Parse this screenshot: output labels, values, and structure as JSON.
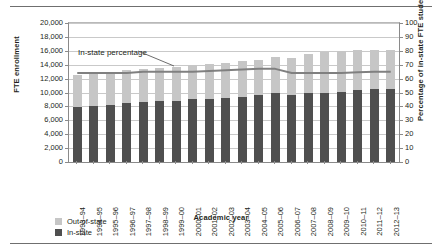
{
  "chart_data": {
    "type": "bar",
    "title": "",
    "subtitle": "",
    "xlabel": "Academic year",
    "ylabel": "FTE enrollment",
    "y2label": "Percentage of in-state FTE students",
    "grid": true,
    "legend_position": "bottom-left",
    "ylim": [
      0,
      20000
    ],
    "y2lim": [
      0,
      100
    ],
    "yticks": [
      "0",
      "2,000",
      "4,000",
      "6,000",
      "8,000",
      "10,000",
      "12,000",
      "14,000",
      "16,000",
      "18,000",
      "20,000"
    ],
    "ytick_values": [
      0,
      2000,
      4000,
      6000,
      8000,
      10000,
      12000,
      14000,
      16000,
      18000,
      20000
    ],
    "y2ticks": [
      "0",
      "10",
      "20",
      "30",
      "40",
      "50",
      "60",
      "70",
      "80",
      "90",
      "100"
    ],
    "y2tick_values": [
      0,
      10,
      20,
      30,
      40,
      50,
      60,
      70,
      80,
      90,
      100
    ],
    "categories": [
      "1993–94",
      "1994–95",
      "1995–96",
      "1996–97",
      "1997–98",
      "1998–99",
      "1999–00",
      "2000–01",
      "2001–02",
      "2002–03",
      "2003–04",
      "2004–05",
      "2005–06",
      "2006–07",
      "2007–08",
      "2008–09",
      "2009–10",
      "2010–11",
      "2011–12",
      "2012–13"
    ],
    "series": [
      {
        "name": "In-state",
        "type": "bar",
        "stack": "enrollment",
        "color": "#4f4f4f",
        "axis": "left",
        "values": [
          7950,
          8050,
          8250,
          8500,
          8650,
          8800,
          8800,
          9000,
          9100,
          9250,
          9400,
          9650,
          9900,
          9700,
          10000,
          10000,
          10100,
          10350,
          10450,
          10500
        ]
      },
      {
        "name": "Out-of-state",
        "type": "bar",
        "stack": "enrollment",
        "color": "#c6c6c6",
        "axis": "left",
        "values": [
          4500,
          4600,
          4650,
          4750,
          4700,
          4750,
          4850,
          4900,
          5000,
          5050,
          5150,
          5100,
          5200,
          5300,
          5600,
          5900,
          5900,
          5750,
          5700,
          5650
        ]
      },
      {
        "name": "In-state percentage",
        "type": "line",
        "color": "#808080",
        "axis": "right",
        "values": [
          64,
          64,
          64,
          64,
          65,
          65,
          65,
          65,
          65.5,
          66,
          66.5,
          67,
          67,
          64,
          64,
          64,
          64,
          64.5,
          65,
          65
        ]
      }
    ],
    "annotations": [
      {
        "text": "In-state percentage",
        "target_category": "1999–00"
      }
    ]
  },
  "legend": {
    "items": [
      {
        "label": "Out-of-state",
        "color": "#c6c6c6"
      },
      {
        "label": "In-state",
        "color": "#4f4f4f"
      }
    ]
  }
}
